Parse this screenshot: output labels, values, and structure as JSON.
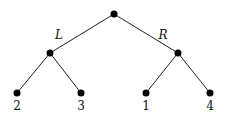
{
  "tree": {
    "nodes": [
      {
        "id": "root",
        "x": 114,
        "y": 14
      },
      {
        "id": "left",
        "x": 50,
        "y": 53
      },
      {
        "id": "right",
        "x": 178,
        "y": 53
      },
      {
        "id": "leaf1",
        "x": 17,
        "y": 93,
        "label": "2"
      },
      {
        "id": "leaf2",
        "x": 81,
        "y": 93,
        "label": "3"
      },
      {
        "id": "leaf3",
        "x": 146,
        "y": 93,
        "label": "1"
      },
      {
        "id": "leaf4",
        "x": 210,
        "y": 93,
        "label": "4"
      }
    ],
    "edges": [
      {
        "from": "root",
        "to": "left",
        "label": "L"
      },
      {
        "from": "root",
        "to": "right",
        "label": "R"
      },
      {
        "from": "left",
        "to": "leaf1"
      },
      {
        "from": "left",
        "to": "leaf2"
      },
      {
        "from": "right",
        "to": "leaf3"
      },
      {
        "from": "right",
        "to": "leaf4"
      }
    ],
    "edge_labels": {
      "left": "L",
      "right": "R"
    },
    "leaf_labels": [
      "2",
      "3",
      "1",
      "4"
    ],
    "colors": {
      "node": "#000000",
      "edge": "#222222"
    }
  }
}
